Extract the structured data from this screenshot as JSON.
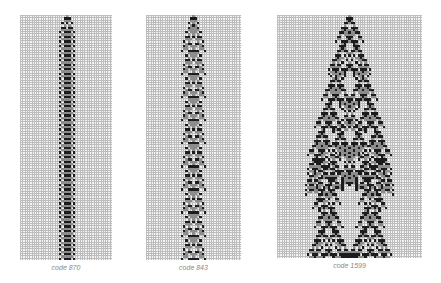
{
  "figure": {
    "panels": [
      {
        "id": "p1",
        "caption": "code 870",
        "code": 870,
        "x": 20,
        "y": 15,
        "width": 92,
        "height": 245,
        "cols": 40,
        "rows": 106
      },
      {
        "id": "p2",
        "caption": "code 843",
        "code": 843,
        "x": 146,
        "y": 15,
        "width": 95,
        "height": 245,
        "cols": 41,
        "rows": 106
      },
      {
        "id": "p3",
        "caption": "code 1599",
        "code": 1599,
        "x": 277,
        "y": 15,
        "width": 145,
        "height": 243,
        "cols": 63,
        "rows": 105
      }
    ],
    "colors": {
      "background": "#ffffff",
      "grid_cell": "#f4f4f4",
      "grid_line": "#bdbdbd",
      "state_1": "#8c8c8c",
      "state_2": "#1c1c1c"
    },
    "ca_type": "3-color totalistic, nearest-neighbor, single seed"
  }
}
